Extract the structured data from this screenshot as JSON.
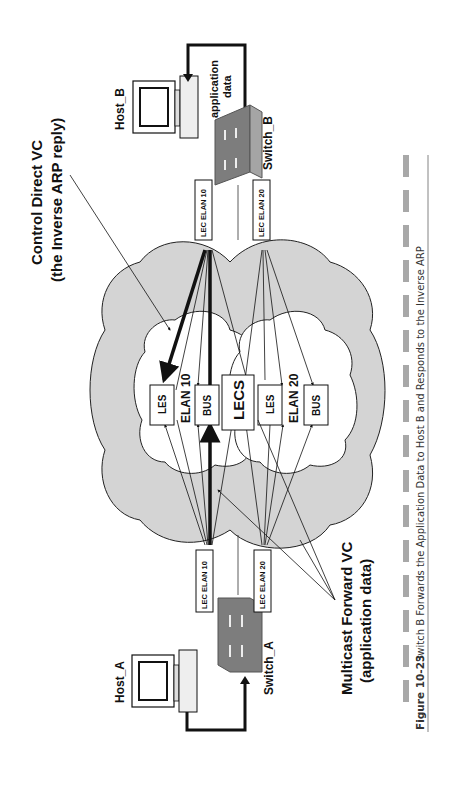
{
  "figure": {
    "number": "Figure 10-23",
    "caption": "Switch B Forwards the Application Data to Host B and Responds to the Inverse ARP"
  },
  "nodes": {
    "host_a": "Host_A",
    "host_b": "Host_B",
    "switch_a": "Switch_A",
    "switch_b": "Switch_B",
    "lec_a_elan10": "LEC ELAN 10",
    "lec_a_elan20": "LEC ELAN 20",
    "lec_b_elan10": "LEC ELAN 10",
    "lec_b_elan20": "LEC ELAN 20",
    "les_10": "LES",
    "elan10": "ELAN 10",
    "bus_10": "BUS",
    "lecs": "LECS",
    "les_20": "LES",
    "elan20": "ELAN 20",
    "bus_20": "BUS"
  },
  "annotations": {
    "control_direct_line1": "Control Direct VC",
    "control_direct_line2": "(the Inverse ARP reply)",
    "multicast_line1": "Multicast Forward VC",
    "multicast_line2": "(application data)",
    "app_data_line1": "application",
    "app_data_line2": "data"
  },
  "colors": {
    "cloud": "#d4d4d4",
    "inner_cloud": "#ffffff",
    "switch": "#8c8c8c",
    "caption_bar": "#a8a8a8"
  }
}
